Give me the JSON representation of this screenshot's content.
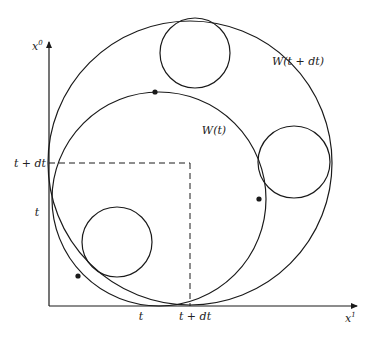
{
  "diagram": {
    "axes": {
      "vertical_label_base": "x",
      "vertical_label_sup": "0",
      "horizontal_label_base": "x",
      "horizontal_label_sup": "1"
    },
    "ticks": {
      "y_t_plus_dt": "t + dt",
      "y_t": "t",
      "x_t": "t",
      "x_t_plus_dt": "t + dt"
    },
    "curves": {
      "outer_label": "W(t + dt)",
      "inner_label": "W(t)"
    },
    "geometry": {
      "outer_circle": {
        "cx": 190,
        "cy": 163,
        "r": 142
      },
      "inner_circle": {
        "cx": 159,
        "cy": 199,
        "r": 107
      },
      "small_circles": [
        {
          "cx": 195,
          "cy": 53,
          "r": 35
        },
        {
          "cx": 294,
          "cy": 162,
          "r": 36
        },
        {
          "cx": 117,
          "cy": 242,
          "r": 35
        }
      ],
      "dots": [
        {
          "cx": 155,
          "cy": 92
        },
        {
          "cx": 259,
          "cy": 199
        },
        {
          "cx": 78,
          "cy": 276
        }
      ]
    },
    "stroke_color": "#1a1a1a"
  }
}
